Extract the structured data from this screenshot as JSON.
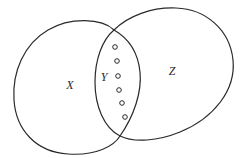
{
  "diagram": {
    "type": "venn",
    "sets": [
      {
        "id": "X",
        "label": "X",
        "label_pos": {
          "x": 70,
          "y": 85
        }
      },
      {
        "id": "Z",
        "label": "Z",
        "label_pos": {
          "x": 172,
          "y": 71
        }
      }
    ],
    "intersection": {
      "id": "Y",
      "label": "Y",
      "label_pos": {
        "x": 104,
        "y": 77
      }
    },
    "intersection_points": [
      {
        "x": 114,
        "y": 30
      },
      {
        "x": 120,
        "y": 136
      }
    ],
    "members_in_intersection": {
      "count": 6,
      "shape": "hollow-circle",
      "points": [
        {
          "x": 115,
          "y": 47
        },
        {
          "x": 117,
          "y": 61
        },
        {
          "x": 118,
          "y": 76
        },
        {
          "x": 119,
          "y": 90
        },
        {
          "x": 122,
          "y": 103
        },
        {
          "x": 125,
          "y": 117
        }
      ]
    },
    "colors": {
      "stroke": "#2a2a2a",
      "background": "#ffffff"
    }
  }
}
